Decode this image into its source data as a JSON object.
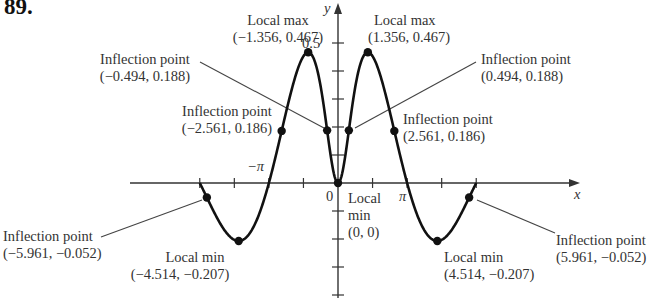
{
  "problem_number": "89.",
  "chart_data": {
    "type": "line",
    "function_hint": "f(x) = x sin x / (1 + x^2)",
    "xlabel": "x",
    "ylabel": "y",
    "x_domain": [
      -6.2832,
      6.2832
    ],
    "x_tick_labels": [
      "-π",
      "0",
      "π"
    ],
    "y_tick_labels": [
      "0.5"
    ],
    "grid": false,
    "points": [
      {
        "type": "Local max",
        "coord": "(−1.356, 0.467)",
        "x": -1.356,
        "y": 0.467
      },
      {
        "type": "Local max",
        "coord": "(1.356, 0.467)",
        "x": 1.356,
        "y": 0.467
      },
      {
        "type": "Inflection point",
        "coord": "(−0.494, 0.188)",
        "x": -0.494,
        "y": 0.188
      },
      {
        "type": "Inflection point",
        "coord": "(0.494, 0.188)",
        "x": 0.494,
        "y": 0.188
      },
      {
        "type": "Inflection point",
        "coord": "(−2.561, 0.186)",
        "x": -2.561,
        "y": 0.186
      },
      {
        "type": "Inflection point",
        "coord": "(2.561, 0.186)",
        "x": 2.561,
        "y": 0.186
      },
      {
        "type": "Local min",
        "coord": "(0, 0)",
        "x": 0,
        "y": 0
      },
      {
        "type": "Local min",
        "coord": "(−4.514, −0.207)",
        "x": -4.514,
        "y": -0.207
      },
      {
        "type": "Local min",
        "coord": "(4.514, −0.207)",
        "x": 4.514,
        "y": -0.207
      },
      {
        "type": "Inflection point",
        "coord": "(−5.961, −0.052)",
        "x": -5.961,
        "y": -0.052
      },
      {
        "type": "Inflection point",
        "coord": "(5.961, −0.052)",
        "x": 5.961,
        "y": -0.052
      }
    ]
  },
  "labels": {
    "localmax_left": {
      "title": "Local max",
      "coord": "(−1.356, 0.467)"
    },
    "localmax_right": {
      "title": "Local max",
      "coord": "(1.356, 0.467)"
    },
    "infl_inner_left": {
      "title": "Inflection point",
      "coord": "(−0.494, 0.188)"
    },
    "infl_inner_right": {
      "title": "Inflection point",
      "coord": "(0.494, 0.188)"
    },
    "infl_mid_left": {
      "title": "Inflection point",
      "coord": "(−2.561, 0.186)"
    },
    "infl_mid_right": {
      "title": "Inflection point",
      "coord": "(2.561, 0.186)"
    },
    "localmin_origin": {
      "line1": "Local",
      "line2": "min",
      "coord": "(0, 0)"
    },
    "localmin_left": {
      "title": "Local min",
      "coord": "(−4.514, −0.207)"
    },
    "localmin_right": {
      "title": "Local min",
      "coord": "(4.514, −0.207)"
    },
    "infl_outer_left": {
      "title": "Inflection point",
      "coord": "(−5.961, −0.052)"
    },
    "infl_outer_right": {
      "title": "Inflection point",
      "coord": "(5.961, −0.052)"
    },
    "x_axis": "x",
    "y_axis": "y",
    "tick_neg_pi": "−π",
    "tick_pi": "π",
    "tick_zero": "0",
    "tick_half": "0.5"
  }
}
